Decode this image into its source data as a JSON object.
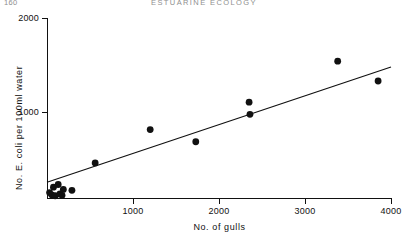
{
  "page": {
    "folio": "160",
    "running_head": "ESTUARINE ECOLOGY"
  },
  "chart_data": {
    "type": "scatter",
    "title": "",
    "xlabel": "No.  of gulls",
    "ylabel": "No. E. coli per 100ml water",
    "xlim": [
      0,
      4000
    ],
    "ylim": [
      0,
      2000
    ],
    "xticks": [
      1000,
      2000,
      3000,
      4000
    ],
    "xtick_labels": [
      "1000",
      "2000",
      "3000",
      "4000"
    ],
    "yticks": [
      1000,
      2000
    ],
    "ytick_labels": [
      "1000",
      "2000"
    ],
    "grid": false,
    "legend": false,
    "points": [
      {
        "x": 30,
        "y": 60
      },
      {
        "x": 55,
        "y": 35
      },
      {
        "x": 75,
        "y": 120
      },
      {
        "x": 95,
        "y": 25
      },
      {
        "x": 130,
        "y": 150
      },
      {
        "x": 150,
        "y": 45
      },
      {
        "x": 175,
        "y": 30
      },
      {
        "x": 190,
        "y": 95
      },
      {
        "x": 290,
        "y": 85
      },
      {
        "x": 560,
        "y": 390
      },
      {
        "x": 1200,
        "y": 760
      },
      {
        "x": 1730,
        "y": 625
      },
      {
        "x": 2350,
        "y": 1065
      },
      {
        "x": 2360,
        "y": 930
      },
      {
        "x": 3380,
        "y": 1520
      },
      {
        "x": 3850,
        "y": 1300
      }
    ],
    "fit_line": {
      "type": "linear-regression",
      "x_start": 0,
      "y_start": 175,
      "x_end": 4000,
      "y_end": 1455
    }
  }
}
